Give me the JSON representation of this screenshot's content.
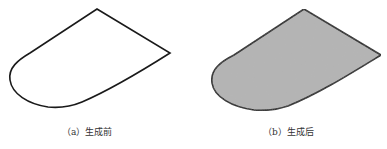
{
  "figure": {
    "panels": [
      {
        "id": "a",
        "caption": "（a）生成前",
        "fill": "#ffffff",
        "stroke": "#1a1a1a",
        "state": "outline-only"
      },
      {
        "id": "b",
        "caption": "（b）生成后",
        "fill": "#b4b4b4",
        "stroke": "#1a1a1a",
        "state": "filled"
      }
    ]
  }
}
